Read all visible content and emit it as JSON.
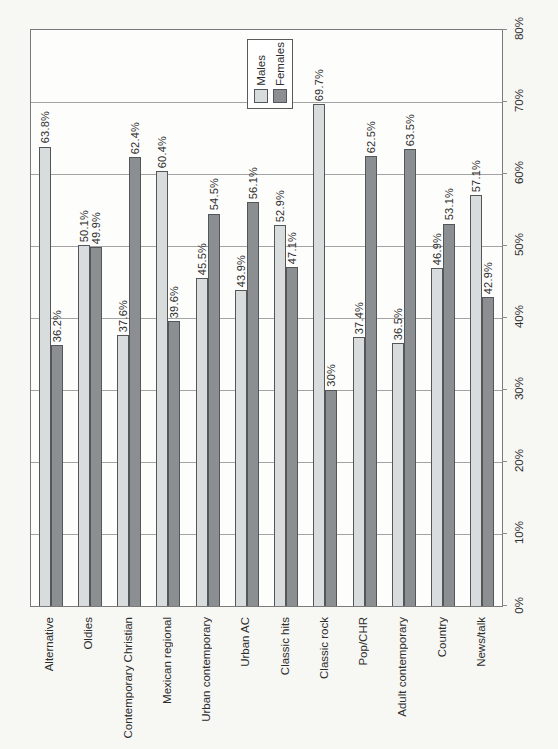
{
  "chart_data": {
    "type": "bar",
    "orientation": "page rotated 90 degrees; all text reads bottom-to-top; percent axis on right edge (0% bottom to 80% top)",
    "categories": [
      "Alternative",
      "Oldies",
      "Contemporary Christian",
      "Mexican regional",
      "Urban contemporary",
      "Urban AC",
      "Classic hits",
      "Classic rock",
      "Pop/CHR",
      "Adult contemporary",
      "Country",
      "News/talk"
    ],
    "series": [
      {
        "name": "Males",
        "color": "#d9dcdc",
        "values": [
          63.8,
          50.1,
          37.6,
          60.4,
          45.5,
          43.9,
          52.9,
          69.7,
          37.4,
          36.5,
          46.9,
          57.1
        ],
        "labels": [
          "63.8%",
          "50.1%",
          "37.6%",
          "60.4%",
          "45.5%",
          "43.9%",
          "52.9%",
          "69.7%",
          "37.4%",
          "36.5%",
          "46.9%",
          "57.1%"
        ]
      },
      {
        "name": "Females",
        "color": "#8b8f91",
        "values": [
          36.2,
          49.9,
          62.4,
          39.6,
          54.5,
          56.1,
          47.1,
          30,
          62.5,
          63.5,
          53.1,
          42.9
        ],
        "labels": [
          "36.2%",
          "49.9%",
          "62.4%",
          "39.6%",
          "54.5%",
          "56.1%",
          "47.1%",
          "30%",
          "62.5%",
          "63.5%",
          "53.1%",
          "42.9%"
        ]
      }
    ],
    "axis": {
      "min": 0,
      "max": 80,
      "step": 10,
      "tick_labels": [
        "0%",
        "10%",
        "20%",
        "30%",
        "40%",
        "50%",
        "60%",
        "70%",
        "80%"
      ],
      "gridlines": true,
      "position": "right"
    },
    "legend": {
      "position": "top-center",
      "entries": [
        {
          "label": "Males",
          "color": "#d9dcdc"
        },
        {
          "label": "Females",
          "color": "#8b8f91"
        }
      ]
    }
  }
}
